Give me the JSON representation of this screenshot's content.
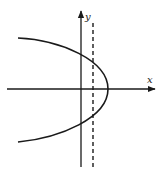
{
  "figure": {
    "type": "parabola-with-vertical-line",
    "axes": {
      "x_label": "x",
      "y_label": "y"
    },
    "colors": {
      "stroke": "#1a1a1a",
      "background": "#ffffff"
    },
    "elements": [
      {
        "name": "x-axis",
        "style": "solid arrow"
      },
      {
        "name": "y-axis",
        "style": "solid arrow"
      },
      {
        "name": "parabola",
        "style": "solid curve",
        "opens": "left"
      },
      {
        "name": "vertical-line",
        "style": "dashed"
      }
    ]
  }
}
